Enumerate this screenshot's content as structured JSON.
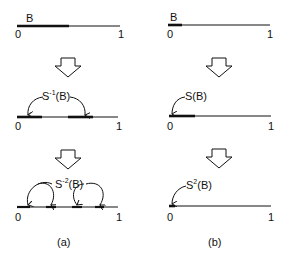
{
  "panels": [
    {
      "caption": "(a)",
      "rows": [
        {
          "set_label": "B",
          "left_tick": "0",
          "right_tick": "1"
        },
        {
          "set_label_main": "S",
          "set_label_sup": "-1",
          "set_label_arg": "(B)",
          "left_tick": "0",
          "right_tick": "1"
        },
        {
          "set_label_main": "S",
          "set_label_sup": "-2",
          "set_label_arg": "(B)",
          "left_tick": "0",
          "right_tick": "1"
        }
      ]
    },
    {
      "caption": "(b)",
      "rows": [
        {
          "set_label": "B",
          "left_tick": "0",
          "right_tick": "1"
        },
        {
          "set_label_main": "S",
          "set_label_arg": "(B)",
          "left_tick": "0",
          "right_tick": "1"
        },
        {
          "set_label_main": "S",
          "set_label_sup": "2",
          "set_label_arg": "(B)",
          "left_tick": "0",
          "right_tick": "1"
        }
      ]
    }
  ]
}
